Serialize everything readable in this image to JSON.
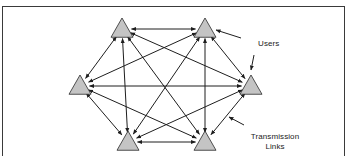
{
  "diagram": {
    "type": "fully-connected-network",
    "labels": {
      "users": "Users",
      "links_line1": "Transmission",
      "links_line2": "Links"
    },
    "colors": {
      "node_fill": "#c4c4c4",
      "node_stroke": "#2a2a2a",
      "edge": "#1e1e1e",
      "frame": "#3a3a3a"
    },
    "nodes": [
      {
        "id": "user-1",
        "position": "top-left"
      },
      {
        "id": "user-2",
        "position": "top-right"
      },
      {
        "id": "user-3",
        "position": "left"
      },
      {
        "id": "user-4",
        "position": "right"
      },
      {
        "id": "user-5",
        "position": "bottom-left"
      },
      {
        "id": "user-6",
        "position": "bottom-right"
      }
    ],
    "edges": [
      [
        "user-1",
        "user-2"
      ],
      [
        "user-1",
        "user-3"
      ],
      [
        "user-1",
        "user-4"
      ],
      [
        "user-1",
        "user-5"
      ],
      [
        "user-1",
        "user-6"
      ],
      [
        "user-2",
        "user-3"
      ],
      [
        "user-2",
        "user-4"
      ],
      [
        "user-2",
        "user-5"
      ],
      [
        "user-2",
        "user-6"
      ],
      [
        "user-3",
        "user-4"
      ],
      [
        "user-3",
        "user-5"
      ],
      [
        "user-3",
        "user-6"
      ],
      [
        "user-4",
        "user-5"
      ],
      [
        "user-4",
        "user-6"
      ],
      [
        "user-5",
        "user-6"
      ]
    ],
    "edge_style": "bidirectional-arrows"
  }
}
